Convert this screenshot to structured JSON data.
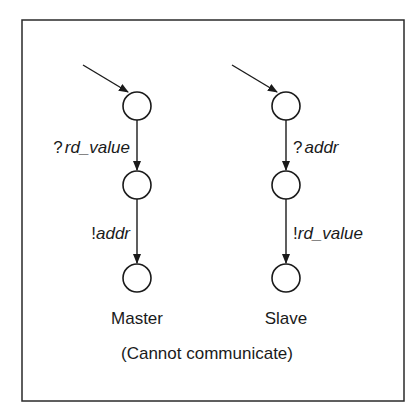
{
  "diagram": {
    "frame": {
      "x": 22,
      "y": 20,
      "width": 382,
      "height": 381,
      "stroke": "#2a2a2a"
    },
    "machines": [
      {
        "name": "Master",
        "x": 137,
        "states_y": [
          106,
          185,
          278
        ],
        "transitions": [
          {
            "prefix": "?",
            "label": "rd_value",
            "side": "left"
          },
          {
            "prefix": "!",
            "label": "addr",
            "side": "left"
          }
        ]
      },
      {
        "name": "Slave",
        "x": 286,
        "states_y": [
          106,
          185,
          278
        ],
        "transitions": [
          {
            "prefix": "?",
            "label": "addr",
            "side": "right"
          },
          {
            "prefix": "!",
            "label": "rd_value",
            "side": "right"
          }
        ]
      }
    ],
    "caption": "(Cannot communicate)",
    "colors": {
      "line": "#1a1a1a",
      "background": "#ffffff"
    }
  }
}
